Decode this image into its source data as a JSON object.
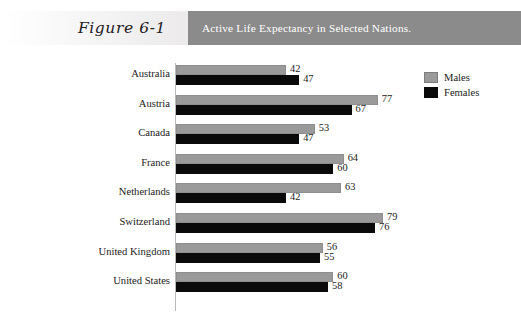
{
  "figure": {
    "label": "Figure 6-1",
    "title": "Active Life Expectancy in Selected Nations."
  },
  "legend": {
    "items": [
      {
        "label": "Males",
        "swatch": "males",
        "color": "#9a9a9a"
      },
      {
        "label": "Females",
        "swatch": "females",
        "color": "#0a0a0a"
      }
    ]
  },
  "chart_data": {
    "type": "bar",
    "orientation": "horizontal",
    "title": "Active Life Expectancy in Selected Nations.",
    "xlabel": "",
    "ylabel": "",
    "categories": [
      "Australia",
      "Austria",
      "Canada",
      "France",
      "Netherlands",
      "Switzerland",
      "United Kingdom",
      "United States"
    ],
    "series": [
      {
        "name": "Males",
        "color": "#9a9a9a",
        "values": [
          42,
          77,
          53,
          64,
          63,
          79,
          56,
          60
        ]
      },
      {
        "name": "Females",
        "color": "#0a0a0a",
        "values": [
          47,
          67,
          47,
          60,
          42,
          76,
          55,
          58
        ]
      }
    ],
    "xlim": [
      0,
      80
    ],
    "grid": false,
    "legend_position": "top-right",
    "value_labels": true
  }
}
